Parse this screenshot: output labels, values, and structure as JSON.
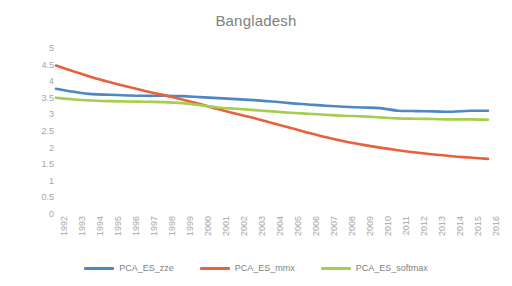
{
  "chart_data": {
    "type": "line",
    "title": "Bangladesh",
    "xlabel": "",
    "ylabel": "",
    "ylim": [
      0,
      5
    ],
    "yticks": [
      "5",
      "4.5",
      "4",
      "3.5",
      "3",
      "2.5",
      "2",
      "1.5",
      "1",
      "0.5",
      "0"
    ],
    "ytick_values": [
      5,
      4.5,
      4,
      3.5,
      3,
      2.5,
      2,
      1.5,
      1,
      0.5,
      0
    ],
    "grid": false,
    "legend_position": "bottom",
    "categories": [
      "1992",
      "1993",
      "1994",
      "1995",
      "1996",
      "1997",
      "1998",
      "1999",
      "2000",
      "2001",
      "2002",
      "2003",
      "2004",
      "2005",
      "2006",
      "2007",
      "2008",
      "2009",
      "2010",
      "2011",
      "2012",
      "2013",
      "2014",
      "2015",
      "2016"
    ],
    "series": [
      {
        "name": "PCA_ES_zze",
        "color": "#4E87C2",
        "values": [
          3.77,
          3.68,
          3.61,
          3.59,
          3.57,
          3.56,
          3.56,
          3.55,
          3.52,
          3.49,
          3.46,
          3.43,
          3.39,
          3.34,
          3.3,
          3.26,
          3.23,
          3.21,
          3.19,
          3.11,
          3.1,
          3.09,
          3.08,
          3.11,
          3.11
        ]
      },
      {
        "name": "PCA_ES_mmx",
        "color": "#E8613C",
        "values": [
          4.47,
          4.29,
          4.12,
          3.97,
          3.83,
          3.7,
          3.58,
          3.45,
          3.31,
          3.16,
          3.02,
          2.89,
          2.74,
          2.6,
          2.45,
          2.31,
          2.19,
          2.09,
          2.0,
          1.92,
          1.85,
          1.79,
          1.74,
          1.7,
          1.66
        ]
      },
      {
        "name": "PCA_ES_softmax",
        "color": "#A5CE4E",
        "values": [
          3.5,
          3.45,
          3.42,
          3.4,
          3.39,
          3.38,
          3.37,
          3.34,
          3.28,
          3.21,
          3.17,
          3.13,
          3.09,
          3.05,
          3.02,
          2.99,
          2.96,
          2.94,
          2.91,
          2.88,
          2.87,
          2.86,
          2.85,
          2.85,
          2.84
        ]
      }
    ]
  },
  "legend": {
    "items": [
      {
        "label": "PCA_ES_zze",
        "color": "#4E87C2"
      },
      {
        "label": "PCA_ES_mmx",
        "color": "#E8613C"
      },
      {
        "label": "PCA_ES_softmax",
        "color": "#A5CE4E"
      }
    ]
  }
}
